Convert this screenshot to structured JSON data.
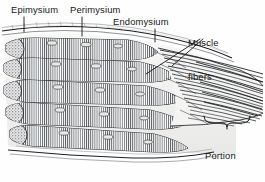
{
  "figure": {
    "style": "black-and-white engraving",
    "background_color": "#fefefe",
    "ink_color": "#15161a",
    "labels": {
      "epimysium": "Epimysium",
      "perimysium": "Perimysium",
      "endomysium": "Endomysium",
      "muscle_fibers_line1": "Muscle",
      "muscle_fibers_line2": "fibers",
      "tendon_line1": "Portion",
      "tendon_line2": "of tendon"
    },
    "annotations": {
      "brace": "curly-brace-spanning-tendon",
      "leader_lines": 5
    }
  }
}
